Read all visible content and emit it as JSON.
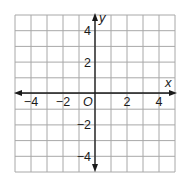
{
  "diagram": {
    "type": "coordinate-plane",
    "x_range": [
      -5,
      5
    ],
    "y_range": [
      -5,
      5
    ],
    "grid_step": 1,
    "axes": {
      "x_label": "x",
      "y_label": "y",
      "origin_label": "O"
    },
    "x_tick_labels": [
      {
        "value": -4,
        "text": "−4"
      },
      {
        "value": -2,
        "text": "−2"
      },
      {
        "value": 2,
        "text": "2"
      },
      {
        "value": 4,
        "text": "4"
      }
    ],
    "y_tick_labels": [
      {
        "value": 4,
        "text": "4"
      },
      {
        "value": 2,
        "text": "2"
      },
      {
        "value": -2,
        "text": "−2"
      },
      {
        "value": -4,
        "text": "−4"
      }
    ],
    "colors": {
      "grid": "#a8a8a8",
      "axes": "#1a1a1a",
      "background": "#ffffff"
    }
  }
}
